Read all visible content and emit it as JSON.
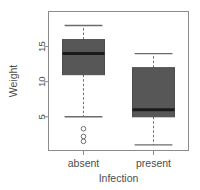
{
  "chart_data": {
    "type": "boxplot",
    "title": "",
    "xlabel": "Infection",
    "ylabel": "Weight",
    "categories": [
      "absent",
      "present"
    ],
    "x_ticks": [
      "absent",
      "present"
    ],
    "y_ticks": [
      5,
      10,
      15
    ],
    "y_tick_labels": [
      "5",
      "10",
      "15"
    ],
    "ylim": [
      0.2,
      20.0
    ],
    "grid": false,
    "legend": null,
    "box_fill": "#575757",
    "box_stroke": "#4d4d4d",
    "median_color": "#1a1a1a",
    "whisker_style": "dashed",
    "frame": true,
    "boxes": [
      {
        "name": "absent",
        "lower_whisker": 5.0,
        "q1": 11.0,
        "median": 14.0,
        "q3": 16.0,
        "upper_whisker": 18.0,
        "outliers": [
          3.3,
          2.2,
          1.5
        ]
      },
      {
        "name": "present",
        "lower_whisker": 1.0,
        "q1": 5.0,
        "median": 6.0,
        "q3": 12.0,
        "upper_whisker": 14.0,
        "outliers": []
      }
    ]
  }
}
